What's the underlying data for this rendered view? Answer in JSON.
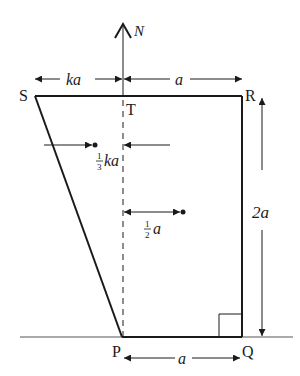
{
  "diagram": {
    "type": "lamina-on-ground",
    "points": {
      "S": {
        "label": "S",
        "x": 35,
        "y": 96
      },
      "T": {
        "label": "T",
        "x": 123,
        "y": 96
      },
      "R": {
        "label": "R",
        "x": 242,
        "y": 96
      },
      "P": {
        "label": "P",
        "x": 122,
        "y": 337
      },
      "Q": {
        "label": "Q",
        "x": 242,
        "y": 337
      }
    },
    "labels": {
      "normal_force": "N",
      "top_left_width": "ka",
      "top_right_width": "a",
      "height": "2a",
      "base_width": "a",
      "triangle_centroid_offset_frac": "1",
      "triangle_centroid_offset_den": "3",
      "triangle_centroid_offset_var": "ka",
      "rect_centroid_offset_frac": "1",
      "rect_centroid_offset_den": "2",
      "rect_centroid_offset_var": "a"
    },
    "colors": {
      "stroke": "#1a1a1a",
      "background": "#ffffff"
    }
  }
}
